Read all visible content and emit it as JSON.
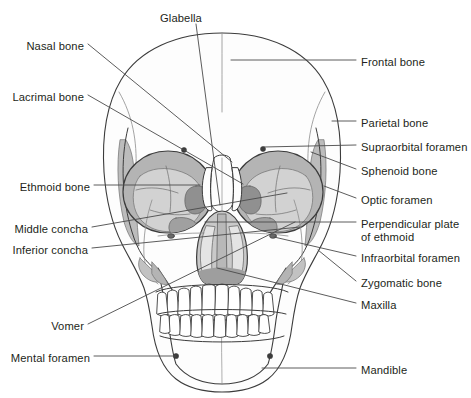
{
  "figure": {
    "width": 471,
    "height": 398,
    "background_color": "#ffffff",
    "line_color": "#3c3c3c",
    "leader_line_color": "#4a4a4a",
    "text_color": "#231f20",
    "fills": {
      "orbit_gray": "#b4b4b4",
      "orbit_inner_light": "#cdcdcd",
      "orbit_dark_accent": "#8c8c8c",
      "temporal_gray": "#bcbcbc",
      "nasal_gray": "#c6c6c6",
      "nasal_dark": "#9a9a9a",
      "bone_white": "#fdfdfd"
    }
  },
  "labels": {
    "top": [
      {
        "id": "glabella",
        "text": "Glabella",
        "side": "center",
        "x": 181,
        "y": 12
      }
    ],
    "left": [
      {
        "id": "nasal-bone",
        "text": "Nasal bone",
        "x": 84,
        "y": 40
      },
      {
        "id": "lacrimal-bone",
        "text": "Lacrimal bone",
        "x": 84,
        "y": 91
      },
      {
        "id": "ethmoid-bone",
        "text": "Ethmoid bone",
        "x": 90,
        "y": 181
      },
      {
        "id": "middle-concha",
        "text": "Middle concha",
        "x": 88,
        "y": 223
      },
      {
        "id": "inferior-concha",
        "text": "Inferior concha",
        "x": 88,
        "y": 244
      },
      {
        "id": "vomer",
        "text": "Vomer",
        "x": 84,
        "y": 320
      },
      {
        "id": "mental-foramen",
        "text": "Mental foramen",
        "x": 90,
        "y": 352
      }
    ],
    "right": [
      {
        "id": "frontal-bone",
        "text": "Frontal bone",
        "x": 361,
        "y": 56
      },
      {
        "id": "parietal-bone",
        "text": "Parietal bone",
        "x": 361,
        "y": 117
      },
      {
        "id": "supraorbital-foramen",
        "text": "Supraorbital foramen",
        "x": 361,
        "y": 141
      },
      {
        "id": "sphenoid-bone",
        "text": "Sphenoid bone",
        "x": 361,
        "y": 165
      },
      {
        "id": "optic-foramen",
        "text": "Optic foramen",
        "x": 361,
        "y": 194
      },
      {
        "id": "perpendicular-plate",
        "text": "Perpendicular plate\nof ethmoid",
        "x": 361,
        "y": 218
      },
      {
        "id": "infraorbital-foramen",
        "text": "Infraorbital foramen",
        "x": 361,
        "y": 252
      },
      {
        "id": "zygomatic-bone",
        "text": "Zygomatic bone",
        "x": 361,
        "y": 277
      },
      {
        "id": "maxilla",
        "text": "Maxilla",
        "x": 361,
        "y": 299
      },
      {
        "id": "mandible",
        "text": "Mandible",
        "x": 361,
        "y": 364
      }
    ]
  },
  "leader_lines": [
    {
      "id": "glabella-leader",
      "points": "196,24 220,205"
    },
    {
      "id": "nasal-bone-leader",
      "points": "88,44 232,162"
    },
    {
      "id": "lacrimal-bone-leader",
      "points": "88,95 243,184"
    },
    {
      "id": "ethmoid-bone-leader",
      "points": "94,185 200,185"
    },
    {
      "id": "middle-concha-leader",
      "points": "92,227 287,193"
    },
    {
      "id": "inferior-concha-leader",
      "points": "92,248 300,227"
    },
    {
      "id": "vomer-leader",
      "points": "88,324 295,222"
    },
    {
      "id": "mental-foramen-leader",
      "points": "94,356 176,356"
    },
    {
      "id": "frontal-bone-leader",
      "points": "356,60 231,60"
    },
    {
      "id": "parietal-bone-leader",
      "points": "356,121 332,121"
    },
    {
      "id": "supraorbital-foramen-leader",
      "points": "356,145 264,145"
    },
    {
      "id": "sphenoid-bone-leader",
      "points": "356,169 311,152"
    },
    {
      "id": "optic-foramen-leader",
      "points": "356,198 324,186"
    },
    {
      "id": "perpendicular-plate-leader",
      "points": "356,222 205,222"
    },
    {
      "id": "infraorbital-foramen-leader",
      "points": "356,256 274,236"
    },
    {
      "id": "zygomatic-bone-leader",
      "points": "356,281 318,250"
    },
    {
      "id": "maxilla-leader",
      "points": "356,303 217,268"
    },
    {
      "id": "mandible-leader",
      "points": "356,368 262,368"
    }
  ],
  "anatomy": {
    "regions": [
      "cranium",
      "frontal-bone",
      "parietal-bone",
      "temporal-bone",
      "left-orbit",
      "right-orbit",
      "nasal-aperture",
      "maxilla",
      "mandible",
      "upper-teeth",
      "lower-teeth"
    ],
    "teeth": {
      "upper_count": 16,
      "lower_count": 16
    },
    "foramina": [
      {
        "id": "supraorbital-foramen-left",
        "cx": 184,
        "cy": 149
      },
      {
        "id": "supraorbital-foramen-right",
        "cx": 264,
        "cy": 148
      },
      {
        "id": "infraorbital-foramen-left",
        "cx": 171,
        "cy": 236
      },
      {
        "id": "infraorbital-foramen-right",
        "cx": 273,
        "cy": 236
      },
      {
        "id": "mental-foramen-left",
        "cx": 176,
        "cy": 356
      },
      {
        "id": "mental-foramen-right",
        "cx": 270,
        "cy": 356
      }
    ]
  }
}
